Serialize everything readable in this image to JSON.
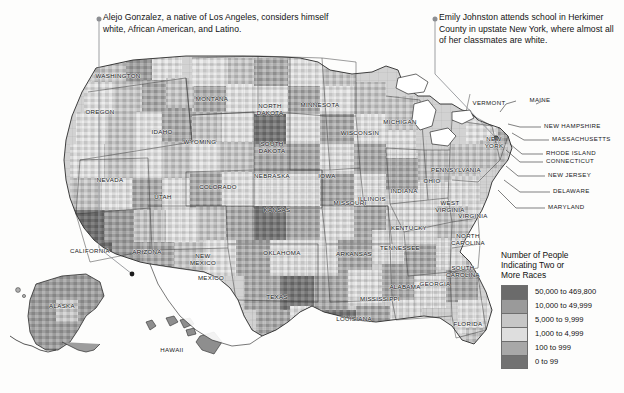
{
  "map": {
    "title": "Number of People Indicating Two or More Races",
    "background_color": "#fdfdfc",
    "water_color": "#ffffff",
    "county_outline_color": "#8a8a8a",
    "state_outline_color": "#2b2b2b"
  },
  "annotations": [
    {
      "id": "alejo",
      "text": "Alejo Gonzalez, a native of Los Angeles, considers himself white, African American, and Latino.",
      "marker_color": "#8d8f93"
    },
    {
      "id": "emily",
      "text": "Emily Johnston attends school in Herkimer County in upstate New York, where almost all of her classmates are white.",
      "marker_color": "#8d8f93"
    }
  ],
  "state_labels": [
    {
      "name": "WASHINGTON",
      "x": 118,
      "y": 72,
      "w": 54
    },
    {
      "name": "OREGON",
      "x": 100,
      "y": 108,
      "w": 42
    },
    {
      "name": "IDAHO",
      "x": 162,
      "y": 128,
      "w": 30
    },
    {
      "name": "MONTANA",
      "x": 212,
      "y": 95,
      "w": 42
    },
    {
      "name": "WYOMING",
      "x": 200,
      "y": 138,
      "w": 44
    },
    {
      "name": "NEVADA",
      "x": 110,
      "y": 176,
      "w": 38
    },
    {
      "name": "UTAH",
      "x": 163,
      "y": 193,
      "w": 26
    },
    {
      "name": "COLORADO",
      "x": 218,
      "y": 183,
      "w": 46
    },
    {
      "name": "CALIFORNIA",
      "x": 90,
      "y": 247,
      "w": 50
    },
    {
      "name": "ARIZONA",
      "x": 147,
      "y": 248,
      "w": 42
    },
    {
      "name": "NEW\nMEXICO",
      "x": 203,
      "y": 252,
      "w": 40
    },
    {
      "name": "NORTH\nDAKOTA",
      "x": 270,
      "y": 102,
      "w": 36
    },
    {
      "name": "SOUTH\nDAKOTA",
      "x": 272,
      "y": 140,
      "w": 36
    },
    {
      "name": "NEBRASKA",
      "x": 272,
      "y": 172,
      "w": 42
    },
    {
      "name": "KANSAS",
      "x": 277,
      "y": 206,
      "w": 36
    },
    {
      "name": "OKLAHOMA",
      "x": 282,
      "y": 249,
      "w": 46
    },
    {
      "name": "TEXAS",
      "x": 277,
      "y": 293,
      "w": 34
    },
    {
      "name": "MINNESOTA",
      "x": 320,
      "y": 101,
      "w": 48
    },
    {
      "name": "IOWA",
      "x": 327,
      "y": 172,
      "w": 26
    },
    {
      "name": "MISSOURI",
      "x": 350,
      "y": 199,
      "w": 40
    },
    {
      "name": "ARKANSAS",
      "x": 354,
      "y": 250,
      "w": 42
    },
    {
      "name": "LOUISIANA",
      "x": 354,
      "y": 315,
      "w": 44
    },
    {
      "name": "WISCONSIN",
      "x": 360,
      "y": 129,
      "w": 44
    },
    {
      "name": "ILLINOIS",
      "x": 372,
      "y": 195,
      "w": 36
    },
    {
      "name": "MICHIGAN",
      "x": 400,
      "y": 118,
      "w": 42
    },
    {
      "name": "INDIANA",
      "x": 404,
      "y": 187,
      "w": 36
    },
    {
      "name": "OHIO",
      "x": 432,
      "y": 177,
      "w": 26
    },
    {
      "name": "KENTUCKY",
      "x": 409,
      "y": 224,
      "w": 42
    },
    {
      "name": "TENNESSEE",
      "x": 400,
      "y": 244,
      "w": 46
    },
    {
      "name": "MISSISSIPPI",
      "x": 380,
      "y": 295,
      "w": 46
    },
    {
      "name": "ALABAMA",
      "x": 405,
      "y": 283,
      "w": 40
    },
    {
      "name": "GEORGIA",
      "x": 435,
      "y": 280,
      "w": 38
    },
    {
      "name": "FLORIDA",
      "x": 468,
      "y": 320,
      "w": 36
    },
    {
      "name": "SOUTH\nCAROLINA",
      "x": 463,
      "y": 264,
      "w": 42
    },
    {
      "name": "NORTH\nCAROLINA",
      "x": 468,
      "y": 232,
      "w": 42
    },
    {
      "name": "VIRGINIA",
      "x": 473,
      "y": 212,
      "w": 36
    },
    {
      "name": "WEST\nVIRGINIA",
      "x": 450,
      "y": 199,
      "w": 34
    },
    {
      "name": "PENNSYLVANIA",
      "x": 456,
      "y": 166,
      "w": 54
    },
    {
      "name": "NEW\nYORK",
      "x": 494,
      "y": 135,
      "w": 28
    },
    {
      "name": "VERMONT",
      "x": 489,
      "y": 99,
      "w": 38
    },
    {
      "name": "MAINE",
      "x": 540,
      "y": 96,
      "w": 28
    },
    {
      "name": "ALASKA",
      "x": 62,
      "y": 302,
      "w": 36
    },
    {
      "name": "HAWAII",
      "x": 172,
      "y": 346,
      "w": 32
    },
    {
      "name": "MEXICO",
      "x": 211,
      "y": 274,
      "w": 34
    }
  ],
  "leader_labels": [
    {
      "name": "NEW HAMPSHIRE",
      "x": 544,
      "y": 125
    },
    {
      "name": "MASSACHUSETTS",
      "x": 552,
      "y": 138
    },
    {
      "name": "RHODE ISLAND",
      "x": 546,
      "y": 152
    },
    {
      "name": "CONNECTICUT",
      "x": 546,
      "y": 160
    },
    {
      "name": "NEW JERSEY",
      "x": 548,
      "y": 174
    },
    {
      "name": "DELAWARE",
      "x": 553,
      "y": 190
    },
    {
      "name": "MARYLAND",
      "x": 548,
      "y": 206
    }
  ],
  "legend": {
    "title": "Number of People\nIndicating Two or\nMore Races",
    "items": [
      {
        "label": "50,000 to 469,800",
        "color": "#6b6b6b"
      },
      {
        "label": "10,000 to 49,999",
        "color": "#9a9a9a"
      },
      {
        "label": "5,000 to 9,999",
        "color": "#c6c6c6"
      },
      {
        "label": "1,000 to 4,999",
        "color": "#dedede"
      },
      {
        "label": "100 to 999",
        "color": "#a8a8a8"
      },
      {
        "label": "0 to 99",
        "color": "#727272"
      }
    ]
  }
}
